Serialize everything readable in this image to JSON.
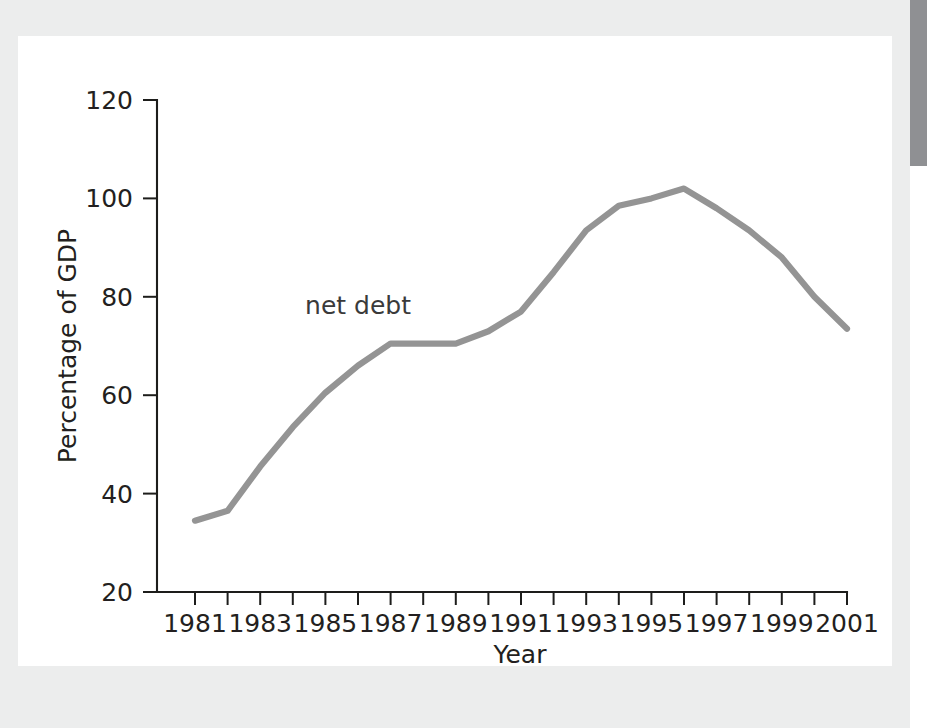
{
  "figure": {
    "background_color": "#ffffff",
    "mount_color": "#eceded",
    "edge_bar_color": "#8f9093"
  },
  "chart_data": {
    "type": "line",
    "title": "",
    "xlabel": "Year",
    "ylabel": "Percentage of GDP",
    "xlim": [
      1981,
      2001
    ],
    "ylim": [
      20,
      120
    ],
    "grid": false,
    "legend": "inline-annotation",
    "annotations": [
      {
        "text": "net debt",
        "x": 1986.0,
        "y": 76.5
      }
    ],
    "x_tick_values": [
      1981,
      1982,
      1983,
      1984,
      1985,
      1986,
      1987,
      1988,
      1989,
      1990,
      1991,
      1992,
      1993,
      1994,
      1995,
      1996,
      1997,
      1998,
      1999,
      2000,
      2001
    ],
    "x_tick_labels": [
      "1981",
      "",
      "1983",
      "",
      "1985",
      "",
      "1987",
      "",
      "1989",
      "",
      "1991",
      "",
      "1993",
      "",
      "1995",
      "",
      "1997",
      "",
      "1999",
      "",
      "2001"
    ],
    "y_tick_values": [
      20,
      40,
      60,
      80,
      100,
      120
    ],
    "y_tick_labels": [
      "20",
      "40",
      "60",
      "80",
      "100",
      "120"
    ],
    "series": [
      {
        "name": "net debt",
        "color": "#949494",
        "x": [
          1981,
          1982,
          1983,
          1984,
          1985,
          1986,
          1987,
          1988,
          1989,
          1990,
          1991,
          1992,
          1993,
          1994,
          1995,
          1996,
          1997,
          1998,
          1999,
          2000,
          2001
        ],
        "values": [
          34.5,
          36.5,
          45.5,
          53.5,
          60.5,
          66.0,
          70.5,
          70.5,
          70.5,
          73.0,
          77.0,
          85.0,
          93.5,
          98.5,
          100.0,
          102.0,
          98.0,
          93.5,
          88.0,
          80.0,
          73.5
        ]
      }
    ]
  }
}
